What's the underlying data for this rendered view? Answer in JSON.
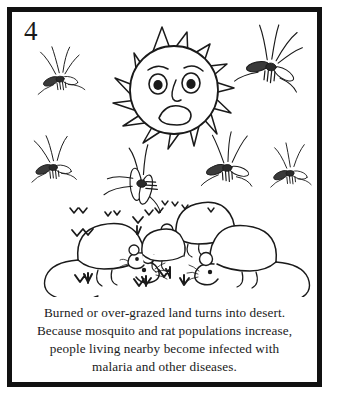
{
  "panel": {
    "number": "4",
    "border_color": "#111111",
    "background_color": "#ffffff",
    "ink_color": "#1a1a1a"
  },
  "illustration": {
    "style": "black-and-white line drawing",
    "sun": {
      "name": "sad-sun",
      "expression": "worried-sad",
      "ray_count": 14,
      "features": [
        "two eyes with raised worried eyebrows",
        "nose",
        "frowning open mouth"
      ]
    },
    "mosquitoes": {
      "count": 6,
      "label": "mosquito"
    },
    "rats": {
      "count": 4,
      "label": "rat"
    },
    "grass_tufts": {
      "count": 11,
      "label": "sparse-dry-grass"
    }
  },
  "caption": {
    "lines": [
      "Burned or over-grazed land turns into desert.",
      "Because mosquito and rat populations increase,",
      "people living nearby become infected with",
      "malaria and other diseases."
    ],
    "line1": "Burned or over-grazed land turns into desert.",
    "line2": "Because mosquito and rat populations increase,",
    "line3": "people living nearby become infected with",
    "line4": "malaria and other diseases."
  }
}
